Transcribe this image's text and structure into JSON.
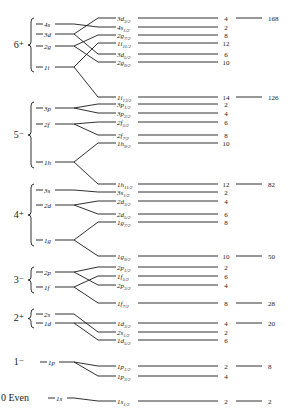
{
  "shells": [
    {
      "label": "6⁺",
      "y": 45,
      "brace_top": 18,
      "brace_bottom": 72
    },
    {
      "label": "5⁻",
      "y": 135,
      "brace_top": 102,
      "brace_bottom": 168
    },
    {
      "label": "4⁺",
      "y": 215,
      "brace_top": 184,
      "brace_bottom": 246
    },
    {
      "label": "3⁻",
      "y": 280,
      "brace_top": 267,
      "brace_bottom": 293
    },
    {
      "label": "2⁺",
      "y": 318,
      "brace_top": 309,
      "brace_bottom": 328
    },
    {
      "label": "1⁻",
      "y": 362,
      "brace_top": null,
      "brace_bottom": null
    },
    {
      "label": "0 Even",
      "y": 398,
      "brace_top": null,
      "brace_bottom": null
    }
  ],
  "levels": [
    {
      "name": "4s",
      "y": 24,
      "split": [
        {
          "name": "4s",
          "j": "1/2",
          "y": 27,
          "deg": 2
        }
      ]
    },
    {
      "name": "3d",
      "y": 34,
      "split": [
        {
          "name": "3d",
          "j": "3/2",
          "y": 18,
          "deg": 4
        },
        {
          "name": "3d",
          "j": "5/2",
          "y": 54,
          "deg": 6
        }
      ]
    },
    {
      "name": "2g",
      "y": 46,
      "split": [
        {
          "name": "2g",
          "j": "7/2",
          "y": 35,
          "deg": 8
        },
        {
          "name": "2g",
          "j": "9/2",
          "y": 62,
          "deg": 10
        }
      ]
    },
    {
      "name": "1i",
      "y": 67,
      "split": [
        {
          "name": "1i",
          "j": "11/2",
          "y": 43,
          "deg": 12
        },
        {
          "name": "1i",
          "j": "13/2",
          "y": 97,
          "deg": 14
        }
      ]
    },
    {
      "name": "3p",
      "y": 108,
      "split": [
        {
          "name": "3p",
          "j": "1/2",
          "y": 104,
          "deg": 2
        },
        {
          "name": "3p",
          "j": "3/2",
          "y": 113,
          "deg": 4
        }
      ]
    },
    {
      "name": "2f",
      "y": 124,
      "split": [
        {
          "name": "2f",
          "j": "5/2",
          "y": 122,
          "deg": 6
        },
        {
          "name": "2f",
          "j": "7/2",
          "y": 135,
          "deg": 8
        }
      ]
    },
    {
      "name": "1h",
      "y": 162,
      "split": [
        {
          "name": "1h",
          "j": "9/2",
          "y": 143,
          "deg": 10
        },
        {
          "name": "1h",
          "j": "11/2",
          "y": 184,
          "deg": 12
        }
      ]
    },
    {
      "name": "3s",
      "y": 190,
      "split": [
        {
          "name": "3s",
          "j": "1/2",
          "y": 192,
          "deg": 2
        }
      ]
    },
    {
      "name": "2d",
      "y": 205,
      "split": [
        {
          "name": "2d",
          "j": "3/2",
          "y": 201,
          "deg": 4
        },
        {
          "name": "2d",
          "j": "5/2",
          "y": 214,
          "deg": 6
        }
      ]
    },
    {
      "name": "1g",
      "y": 240,
      "split": [
        {
          "name": "1g",
          "j": "7/2",
          "y": 222,
          "deg": 8
        },
        {
          "name": "1g",
          "j": "9/2",
          "y": 256,
          "deg": 10
        }
      ]
    },
    {
      "name": "2p",
      "y": 272,
      "split": [
        {
          "name": "2p",
          "j": "1/2",
          "y": 267,
          "deg": 2
        },
        {
          "name": "2p",
          "j": "3/2",
          "y": 285,
          "deg": 4
        }
      ]
    },
    {
      "name": "1f",
      "y": 287,
      "split": [
        {
          "name": "1f",
          "j": "5/2",
          "y": 276,
          "deg": 6
        },
        {
          "name": "1f",
          "j": "7/2",
          "y": 303,
          "deg": 8
        }
      ]
    },
    {
      "name": "2s",
      "y": 314,
      "split": [
        {
          "name": "2s",
          "j": "1/2",
          "y": 332,
          "deg": 2
        }
      ]
    },
    {
      "name": "1d",
      "y": 323,
      "split": [
        {
          "name": "1d",
          "j": "3/2",
          "y": 323,
          "deg": 4
        },
        {
          "name": "1d",
          "j": "5/2",
          "y": 340,
          "deg": 6
        }
      ]
    },
    {
      "name": "1p",
      "y": 362,
      "split": [
        {
          "name": "1p",
          "j": "1/2",
          "y": 366,
          "deg": 2
        },
        {
          "name": "1p",
          "j": "3/2",
          "y": 376,
          "deg": 4
        }
      ]
    },
    {
      "name": "1s",
      "y": 398,
      "split": [
        {
          "name": "1s",
          "j": "1/2",
          "y": 401,
          "deg": 2
        }
      ]
    }
  ],
  "magic_numbers": [
    {
      "value": "168",
      "y": 18
    },
    {
      "value": "126",
      "y": 97
    },
    {
      "value": "82",
      "y": 184
    },
    {
      "value": "50",
      "y": 256
    },
    {
      "value": "28",
      "y": 303
    },
    {
      "value": "20",
      "y": 323
    },
    {
      "value": "8",
      "y": 366
    },
    {
      "value": "2",
      "y": 401
    }
  ],
  "colors": {
    "ink": "#1a1a1a",
    "background": "#ffffff"
  }
}
